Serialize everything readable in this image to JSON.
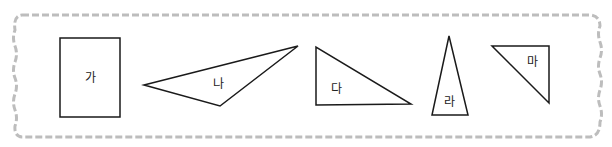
{
  "diagram": {
    "border": {
      "style": "wavy-dashed",
      "color": "#b8b8b8"
    },
    "shapes": [
      {
        "id": "ga",
        "type": "rectangle",
        "label": "가",
        "points": [
          [
            60,
            38
          ],
          [
            120,
            38
          ],
          [
            120,
            117
          ],
          [
            60,
            117
          ]
        ],
        "label_pos": [
          90,
          82
        ]
      },
      {
        "id": "na",
        "type": "triangle",
        "label": "나",
        "points": [
          [
            144,
            85
          ],
          [
            298,
            46
          ],
          [
            220,
            106
          ]
        ],
        "label_pos": [
          218,
          88
        ]
      },
      {
        "id": "da",
        "type": "triangle",
        "label": "다",
        "points": [
          [
            316,
            47
          ],
          [
            316,
            105
          ],
          [
            411,
            104
          ]
        ],
        "label_pos": [
          336,
          93
        ]
      },
      {
        "id": "ra",
        "type": "triangle",
        "label": "라",
        "points": [
          [
            449,
            36
          ],
          [
            432,
            115
          ],
          [
            468,
            115
          ]
        ],
        "label_pos": [
          449,
          106
        ]
      },
      {
        "id": "ma",
        "type": "triangle",
        "label": "마",
        "points": [
          [
            492,
            46
          ],
          [
            549,
            46
          ],
          [
            549,
            103
          ]
        ],
        "label_pos": [
          532,
          66
        ]
      }
    ],
    "stroke_color": "#1a1a1a"
  }
}
